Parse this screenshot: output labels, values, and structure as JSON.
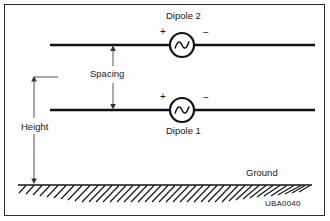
{
  "figure": {
    "id_label": "UBA0040",
    "background_color": "#fdfdfd",
    "line_color": "#111111",
    "border_color": "#2b2b2b"
  },
  "labels": {
    "dipole_upper": "Dipole 2",
    "dipole_lower": "Dipole 1",
    "spacing": "Spacing",
    "height": "Height",
    "ground": "Ground"
  },
  "polarity": {
    "upper_positive": "+",
    "upper_negative": "−",
    "lower_positive": "+",
    "lower_negative": "−"
  },
  "diagram": {
    "type": "antenna-elevation-schematic",
    "elements": [
      {
        "name": "dipole-2-wire",
        "y": 45,
        "x_start": 50,
        "x_end": 315
      },
      {
        "name": "dipole-1-wire",
        "y": 110,
        "x_start": 50,
        "x_end": 315
      },
      {
        "name": "ac-source-upper",
        "cx": 182,
        "cy": 45,
        "r": 12
      },
      {
        "name": "ac-source-lower",
        "cx": 182,
        "cy": 110,
        "r": 12
      },
      {
        "name": "spacing-dimension",
        "x": 113,
        "y_top": 45,
        "y_bottom": 110
      },
      {
        "name": "height-dimension",
        "x": 34,
        "y_top": 77,
        "y_bottom": 185
      },
      {
        "name": "ground-line",
        "y": 185,
        "x_start": 18,
        "x_end": 312
      }
    ]
  }
}
